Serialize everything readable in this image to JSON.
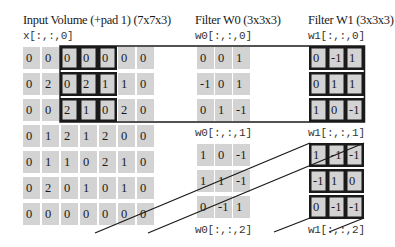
{
  "input": {
    "title": "Input Volume (+pad 1) (7x7x3)",
    "slice_label": "x[:,:,0]",
    "matrix": [
      [
        "0",
        "0",
        "0",
        "0",
        "0",
        "0",
        "0"
      ],
      [
        "0",
        "2",
        "0",
        "2",
        "1",
        "1",
        "0"
      ],
      [
        "0",
        "0",
        "2",
        "1",
        "0",
        "2",
        "0"
      ],
      [
        "0",
        "1",
        "2",
        "1",
        "2",
        "0",
        "0"
      ],
      [
        "0",
        "1",
        "1",
        "0",
        "2",
        "1",
        "0"
      ],
      [
        "0",
        "2",
        "0",
        "1",
        "0",
        "1",
        "0"
      ],
      [
        "0",
        "0",
        "0",
        "0",
        "0",
        "0",
        "0"
      ]
    ]
  },
  "filter_w0": {
    "title": "Filter W0 (3x3x3)",
    "slices": [
      {
        "label": "w0[:,:,0]",
        "matrix": [
          [
            "0",
            "0",
            "1"
          ],
          [
            "-1",
            "0",
            "1"
          ],
          [
            "0",
            "1",
            "-1"
          ]
        ]
      },
      {
        "label": "w0[:,:,1]",
        "matrix": [
          [
            "1",
            "0",
            "-1"
          ],
          [
            "1",
            "1",
            "-1"
          ],
          [
            "0",
            "-1",
            "1"
          ]
        ]
      },
      {
        "label": "w0[:,:,2]"
      }
    ]
  },
  "filter_w1": {
    "title": "Filter W1 (3x3x3)",
    "slices": [
      {
        "label": "w1[:,:,0]",
        "matrix": [
          [
            "0",
            "-1",
            "1"
          ],
          [
            "0",
            "1",
            "1"
          ],
          [
            "1",
            "0",
            "-1"
          ]
        ]
      },
      {
        "label": "w1[:,:,1]",
        "matrix": [
          [
            "1",
            "-1",
            "-1"
          ],
          [
            "-1",
            "1",
            "0"
          ],
          [
            "0",
            "-1",
            "-1"
          ]
        ]
      },
      {
        "label": "w1[:,:,2]"
      }
    ]
  },
  "colors": {
    "cell_fill": "#d3d3d3",
    "outline": "#1a1a1a",
    "background": "#ffffff"
  }
}
